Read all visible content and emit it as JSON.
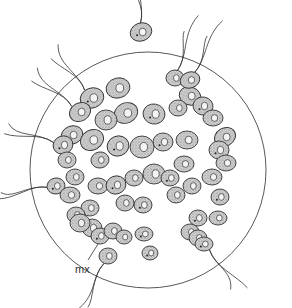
{
  "figure": {
    "label_mx": "mx",
    "colors": {
      "line": "#3a3a3a",
      "cell_fill": "#b9b9b9",
      "cell_light": "#e2e2e2",
      "background": "#ffffff"
    },
    "matrix": {
      "cx": 148,
      "cy": 170,
      "r": 118
    },
    "cells": [
      [
        141,
        32,
        11,
        9,
        -20
      ],
      [
        175,
        78,
        9,
        8,
        0
      ],
      [
        190,
        96,
        11,
        9,
        20
      ],
      [
        203,
        106,
        10,
        9,
        10
      ],
      [
        213,
        118,
        10,
        8,
        0
      ],
      [
        190,
        80,
        10,
        8,
        -20
      ],
      [
        92,
        98,
        12,
        10,
        -20
      ],
      [
        118,
        88,
        12,
        10,
        -15
      ],
      [
        80,
        112,
        11,
        9,
        -30
      ],
      [
        72,
        135,
        11,
        9,
        -20
      ],
      [
        92,
        140,
        12,
        10,
        -30
      ],
      [
        126,
        113,
        12,
        10,
        -25
      ],
      [
        154,
        114,
        11,
        10,
        10
      ],
      [
        178,
        108,
        9,
        8,
        0
      ],
      [
        106,
        120,
        11,
        10,
        0
      ],
      [
        63,
        145,
        10,
        9,
        -20
      ],
      [
        67,
        160,
        9,
        8,
        0
      ],
      [
        225,
        137,
        11,
        9,
        -30
      ],
      [
        219,
        150,
        10,
        9,
        0
      ],
      [
        226,
        163,
        10,
        8,
        0
      ],
      [
        187,
        140,
        11,
        9,
        0
      ],
      [
        163,
        142,
        10,
        9,
        0
      ],
      [
        184,
        164,
        10,
        8,
        0
      ],
      [
        142,
        147,
        12,
        11,
        0
      ],
      [
        118,
        146,
        11,
        10,
        -20
      ],
      [
        100,
        160,
        9,
        8,
        -10
      ],
      [
        75,
        177,
        9,
        8,
        0
      ],
      [
        56,
        186,
        9,
        8,
        -10
      ],
      [
        70,
        195,
        10,
        8,
        0
      ],
      [
        98,
        186,
        10,
        8,
        0
      ],
      [
        116,
        185,
        10,
        9,
        -20
      ],
      [
        154,
        174,
        11,
        10,
        0
      ],
      [
        134,
        178,
        9,
        8,
        0
      ],
      [
        170,
        178,
        9,
        8,
        0
      ],
      [
        192,
        186,
        9,
        8,
        0
      ],
      [
        212,
        177,
        10,
        8,
        0
      ],
      [
        220,
        197,
        9,
        8,
        0
      ],
      [
        90,
        208,
        9,
        8,
        0
      ],
      [
        76,
        215,
        9,
        8,
        0
      ],
      [
        143,
        205,
        9,
        8,
        0
      ],
      [
        125,
        203,
        9,
        8,
        0
      ],
      [
        176,
        195,
        9,
        8,
        0
      ],
      [
        198,
        218,
        9,
        8,
        0
      ],
      [
        218,
        218,
        9,
        7,
        0
      ],
      [
        92,
        228,
        10,
        9,
        0
      ],
      [
        100,
        236,
        9,
        8,
        0
      ],
      [
        113,
        231,
        9,
        8,
        0
      ],
      [
        124,
        237,
        8,
        7,
        0
      ],
      [
        144,
        234,
        9,
        7,
        0
      ],
      [
        80,
        223,
        10,
        9,
        0
      ],
      [
        108,
        256,
        9,
        8,
        0
      ],
      [
        150,
        253,
        8,
        7,
        0
      ],
      [
        190,
        232,
        9,
        8,
        0
      ],
      [
        198,
        238,
        9,
        8,
        0
      ],
      [
        204,
        244,
        9,
        7,
        0
      ]
    ]
  }
}
